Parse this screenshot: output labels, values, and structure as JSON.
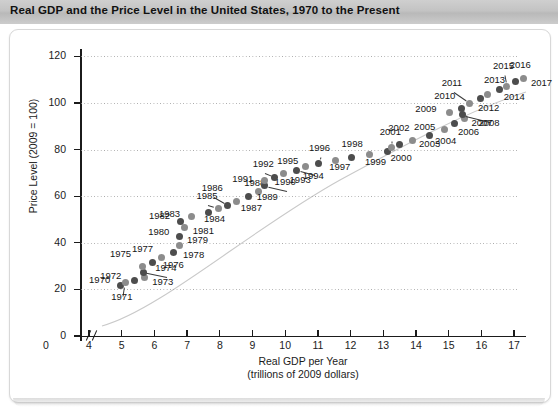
{
  "header": {
    "title": "Real GDP and the Price Level in the United States, 1970 to the Present"
  },
  "chart_data": {
    "type": "scatter",
    "title": "Real GDP and the Price Level in the United States, 1970 to the Present",
    "xlabel": "Real GDP per Year",
    "xlabel_sub": "(trillions of 2009 dollars)",
    "ylabel": "Price Level (2009 = 100)",
    "xlim": [
      4,
      17
    ],
    "ylim": [
      0,
      120
    ],
    "xticks": [
      "0",
      "4",
      "5",
      "6",
      "7",
      "8",
      "9",
      "10",
      "11",
      "12",
      "13",
      "14",
      "15",
      "16",
      "17"
    ],
    "yticks": [
      "0",
      "20",
      "40",
      "60",
      "80",
      "100",
      "120"
    ],
    "axis_break": true,
    "grid": "horizontal-dotted",
    "legend": "none",
    "point_color": "#4d4d4d",
    "label_color": "#151515",
    "points": [
      {
        "label": "1970",
        "x": 4.95,
        "y": 21.7,
        "lx": -31,
        "ly": -5,
        "leader": false
      },
      {
        "label": "1971",
        "x": 5.11,
        "y": 22.8,
        "lx": -14,
        "ly": 14,
        "leader": true
      },
      {
        "label": "1972",
        "x": 5.38,
        "y": 23.8,
        "lx": -34,
        "ly": -5,
        "leader": false
      },
      {
        "label": "1973",
        "x": 5.69,
        "y": 25.1,
        "lx": 8,
        "ly": 4,
        "leader": false
      },
      {
        "label": "1974",
        "x": 5.66,
        "y": 27.4,
        "lx": 12,
        "ly": -4,
        "leader": true
      },
      {
        "label": "1975",
        "x": 5.65,
        "y": 29.9,
        "lx": -33,
        "ly": -12,
        "leader": false
      },
      {
        "label": "1976",
        "x": 5.95,
        "y": 31.6,
        "lx": 10,
        "ly": 3,
        "leader": false
      },
      {
        "label": "1977",
        "x": 6.23,
        "y": 33.6,
        "lx": -30,
        "ly": -9,
        "leader": false
      },
      {
        "label": "1978",
        "x": 6.57,
        "y": 36.0,
        "lx": 10,
        "ly": 3,
        "leader": false
      },
      {
        "label": "1979",
        "x": 6.78,
        "y": 38.9,
        "lx": 7,
        "ly": -5,
        "leader": false
      },
      {
        "label": "1980",
        "x": 6.76,
        "y": 42.5,
        "lx": -31,
        "ly": -5,
        "leader": false
      },
      {
        "label": "1981",
        "x": 6.93,
        "y": 46.5,
        "lx": 8,
        "ly": 3,
        "leader": false
      },
      {
        "label": "1982",
        "x": 6.81,
        "y": 49.2,
        "lx": -32,
        "ly": -5,
        "leader": false
      },
      {
        "label": "1983",
        "x": 7.12,
        "y": 51.3,
        "lx": -32,
        "ly": -2,
        "leader": false
      },
      {
        "label": "1984",
        "x": 7.64,
        "y": 53.1,
        "lx": -4,
        "ly": 7,
        "leader": false
      },
      {
        "label": "1985",
        "x": 7.96,
        "y": 54.8,
        "lx": -22,
        "ly": -12,
        "leader": true
      },
      {
        "label": "1986",
        "x": 8.24,
        "y": 56.2,
        "lx": -26,
        "ly": -17,
        "leader": true
      },
      {
        "label": "1987",
        "x": 8.52,
        "y": 57.9,
        "lx": 4,
        "ly": 7,
        "leader": false
      },
      {
        "label": "1988",
        "x": 8.87,
        "y": 59.9,
        "lx": -4,
        "ly": -13,
        "leader": false
      },
      {
        "label": "1989",
        "x": 9.19,
        "y": 62.2,
        "lx": -2,
        "ly": 6,
        "leader": false
      },
      {
        "label": "1990",
        "x": 9.37,
        "y": 64.5,
        "lx": 10,
        "ly": -4,
        "leader": true
      },
      {
        "label": "1991",
        "x": 9.36,
        "y": 66.7,
        "lx": -32,
        "ly": -2,
        "leader": false
      },
      {
        "label": "1992",
        "x": 9.68,
        "y": 68.2,
        "lx": -22,
        "ly": -13,
        "leader": true
      },
      {
        "label": "1993",
        "x": 9.95,
        "y": 69.8,
        "lx": 6,
        "ly": 7,
        "leader": false
      },
      {
        "label": "1994",
        "x": 10.35,
        "y": 71.2,
        "lx": 6,
        "ly": 6,
        "leader": true
      },
      {
        "label": "1995",
        "x": 10.61,
        "y": 72.6,
        "lx": -28,
        "ly": -6,
        "leader": false
      },
      {
        "label": "1996",
        "x": 11.03,
        "y": 74.1,
        "lx": -10,
        "ly": -15,
        "leader": true
      },
      {
        "label": "1997",
        "x": 11.53,
        "y": 75.4,
        "lx": -6,
        "ly": 7,
        "leader": false
      },
      {
        "label": "1998",
        "x": 12.03,
        "y": 76.4,
        "lx": -10,
        "ly": -14,
        "leader": false
      },
      {
        "label": "1999",
        "x": 12.59,
        "y": 77.7,
        "lx": -5,
        "ly": 7,
        "leader": false
      },
      {
        "label": "2000",
        "x": 13.13,
        "y": 79.3,
        "lx": 3,
        "ly": 7,
        "leader": false
      },
      {
        "label": "2001",
        "x": 13.26,
        "y": 81.1,
        "lx": -12,
        "ly": -15,
        "leader": true
      },
      {
        "label": "2002",
        "x": 13.49,
        "y": 82.4,
        "lx": -11,
        "ly": -16,
        "leader": false
      },
      {
        "label": "2003",
        "x": 13.88,
        "y": 84.0,
        "lx": 7,
        "ly": 4,
        "leader": false
      },
      {
        "label": "2004",
        "x": 14.4,
        "y": 86.1,
        "lx": 6,
        "ly": 6,
        "leader": false
      },
      {
        "label": "2005",
        "x": 14.86,
        "y": 88.6,
        "lx": -30,
        "ly": -3,
        "leader": false
      },
      {
        "label": "2006",
        "x": 15.19,
        "y": 91.0,
        "lx": 3,
        "ly": 8,
        "leader": false
      },
      {
        "label": "2007",
        "x": 15.48,
        "y": 93.2,
        "lx": 7,
        "ly": 4,
        "leader": false
      },
      {
        "label": "2008",
        "x": 15.42,
        "y": 95.0,
        "lx": 16,
        "ly": 8,
        "leader": true
      },
      {
        "label": "2009",
        "x": 15.02,
        "y": 96.1,
        "lx": -34,
        "ly": -3,
        "leader": false
      },
      {
        "label": "2010",
        "x": 15.38,
        "y": 97.8,
        "lx": -27,
        "ly": -12,
        "leader": false
      },
      {
        "label": "2011",
        "x": 15.64,
        "y": 99.8,
        "lx": -28,
        "ly": -20,
        "leader": true
      },
      {
        "label": "2012",
        "x": 15.96,
        "y": 101.9,
        "lx": -2,
        "ly": 9,
        "leader": false
      },
      {
        "label": "2013",
        "x": 16.2,
        "y": 103.5,
        "lx": -4,
        "ly": -15,
        "leader": false
      },
      {
        "label": "2014",
        "x": 16.56,
        "y": 105.6,
        "lx": 4,
        "ly": 7,
        "leader": false
      },
      {
        "label": "2015",
        "x": 16.78,
        "y": 107.1,
        "lx": -14,
        "ly": -20,
        "leader": true
      },
      {
        "label": "2016",
        "x": 17.05,
        "y": 109.2,
        "lx": -6,
        "ly": -17,
        "leader": false
      },
      {
        "label": "2017",
        "x": 17.3,
        "y": 110.4,
        "lx": 7,
        "ly": 4,
        "leader": false
      }
    ]
  }
}
